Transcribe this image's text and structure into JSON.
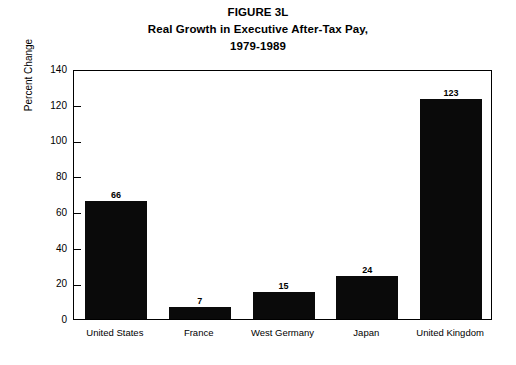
{
  "chart_data": {
    "type": "bar",
    "title": "FIGURE 3L",
    "title_lines": [
      "FIGURE 3L",
      "Real Growth in Executive After-Tax Pay,",
      "1979-1989"
    ],
    "categories": [
      "United States",
      "France",
      "West Germany",
      "Japan",
      "United Kingdom"
    ],
    "values": [
      66,
      7,
      15,
      24,
      123
    ],
    "value_labels": [
      "66",
      "7",
      "15",
      "24",
      "123"
    ],
    "xlabel": "",
    "ylabel": "Percent Change",
    "ylim": [
      0,
      140
    ],
    "ytick_values": [
      0,
      20,
      40,
      60,
      80,
      100,
      120,
      140
    ],
    "ytick_labels": [
      "0",
      "20",
      "40",
      "60",
      "80",
      "100",
      "120",
      "140"
    ],
    "grid": false,
    "legend": false,
    "bar_color": "#0a0a0a",
    "axis_color": "#000000",
    "background_color": "#ffffff"
  }
}
